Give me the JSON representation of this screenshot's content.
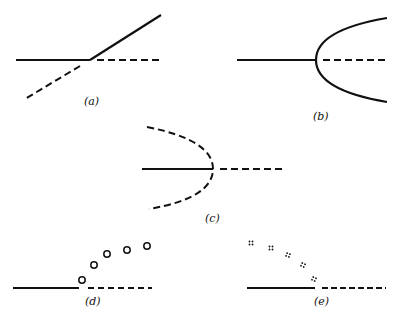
{
  "figure": {
    "stroke_color": "#111111",
    "panels": [
      {
        "id": "a",
        "label": "(a)",
        "type": "transcritical",
        "description": "stable branch exchanges stability with crossing branch"
      },
      {
        "id": "b",
        "label": "(b)",
        "type": "supercritical-pitchfork",
        "description": "solid branch becomes dashed; solid parabola branches"
      },
      {
        "id": "c",
        "label": "(c)",
        "type": "subcritical-pitchfork",
        "description": "solid branch becomes dashed; dashed parabola branches"
      },
      {
        "id": "d",
        "label": "(d)",
        "type": "supercritical-hopf",
        "description": "solid branch becomes dashed; open circles mark periodic orbit amplitude"
      },
      {
        "id": "e",
        "label": "(e)",
        "type": "subcritical-hopf",
        "description": "solid branch becomes dashed; dotted clusters mark unstable orbit amplitude"
      }
    ]
  }
}
